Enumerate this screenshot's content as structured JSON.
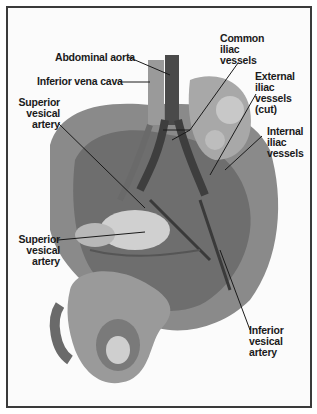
{
  "figure": {
    "type": "anatomical illustration",
    "labels": {
      "abdominal_aorta": "Abdominal aorta",
      "inferior_vena_cava": "Inferior vena cava",
      "common_iliac": [
        "Common",
        "iliac",
        "vessels"
      ],
      "external_iliac": [
        "External",
        "iliac",
        "vessels",
        "(cut)"
      ],
      "internal_iliac": [
        "Internal",
        "iliac",
        "vessels"
      ],
      "superior_vesical_upper": [
        "Superior",
        "vesical",
        "artery"
      ],
      "superior_vesical_lower": [
        "Superior",
        "vesical",
        "artery"
      ],
      "inferior_vesical": [
        "Inferior",
        "vesical",
        "artery"
      ]
    },
    "colors": {
      "border": "#3a3a3a",
      "tissue_dark": "#4a4a4a",
      "tissue_mid": "#8a8a8a",
      "tissue_light": "#c8c8c8",
      "text": "#1a1a1a"
    }
  }
}
